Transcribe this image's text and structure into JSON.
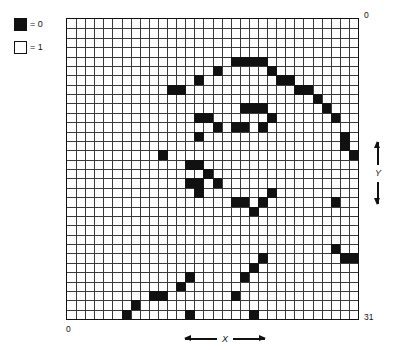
{
  "legend": {
    "items": [
      {
        "swatch": "filled-square",
        "text": "= 0"
      },
      {
        "swatch": "empty-square",
        "text": "= 1"
      }
    ]
  },
  "axes": {
    "x_label": "X",
    "y_label": "Y",
    "top_right": "0",
    "bottom_left": "0",
    "bottom_right": "31",
    "x_min": 0,
    "x_max": 31,
    "y_min": 0,
    "y_max": 31
  },
  "colors": {
    "cell_on": "#111111",
    "cell_off": "#ffffff",
    "grid_line": "#3a3a3a",
    "border": "#111111",
    "background": "#ffffff"
  },
  "chart_data": {
    "type": "heatmap",
    "title": "",
    "xlabel": "X",
    "ylabel": "Y",
    "xlim": [
      0,
      31
    ],
    "ylim": [
      0,
      31
    ],
    "grid": true,
    "legend_position": "top-left",
    "rows": 32,
    "cols": 32,
    "value_on": 0,
    "value_off": 1,
    "on_cells": [
      [
        18,
        4
      ],
      [
        19,
        4
      ],
      [
        20,
        4
      ],
      [
        21,
        4
      ],
      [
        16,
        5
      ],
      [
        22,
        5
      ],
      [
        14,
        6
      ],
      [
        23,
        6
      ],
      [
        24,
        6
      ],
      [
        11,
        7
      ],
      [
        12,
        7
      ],
      [
        25,
        7
      ],
      [
        26,
        7
      ],
      [
        27,
        8
      ],
      [
        19,
        9
      ],
      [
        20,
        9
      ],
      [
        21,
        9
      ],
      [
        28,
        9
      ],
      [
        14,
        10
      ],
      [
        15,
        10
      ],
      [
        22,
        10
      ],
      [
        29,
        10
      ],
      [
        16,
        11
      ],
      [
        18,
        11
      ],
      [
        19,
        11
      ],
      [
        21,
        11
      ],
      [
        14,
        12
      ],
      [
        30,
        12
      ],
      [
        30,
        13
      ],
      [
        10,
        14
      ],
      [
        31,
        14
      ],
      [
        13,
        15
      ],
      [
        14,
        15
      ],
      [
        15,
        16
      ],
      [
        13,
        17
      ],
      [
        14,
        17
      ],
      [
        16,
        17
      ],
      [
        14,
        18
      ],
      [
        22,
        18
      ],
      [
        18,
        19
      ],
      [
        19,
        19
      ],
      [
        21,
        19
      ],
      [
        29,
        19
      ],
      [
        20,
        20
      ],
      [
        29,
        24
      ],
      [
        21,
        25
      ],
      [
        30,
        25
      ],
      [
        31,
        25
      ],
      [
        20,
        26
      ],
      [
        13,
        27
      ],
      [
        19,
        27
      ],
      [
        12,
        28
      ],
      [
        9,
        29
      ],
      [
        10,
        29
      ],
      [
        18,
        29
      ],
      [
        7,
        30
      ],
      [
        6,
        31
      ],
      [
        13,
        31
      ],
      [
        20,
        31
      ]
    ]
  }
}
